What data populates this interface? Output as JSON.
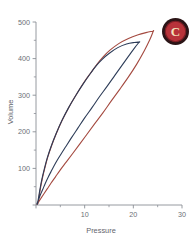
{
  "figure": {
    "panel_label": "C",
    "background_color": "#ffffff",
    "axis_color": "#8a8e95",
    "label_color": "#6b6f76"
  },
  "badge": {
    "letter": "C",
    "ring_color": "#2b1416",
    "fill_color": "#b8333a",
    "letter_color": "#f3e3bd",
    "name": "panel-label-c"
  },
  "chart_data": {
    "type": "line",
    "title": "",
    "xlabel": "Pressure",
    "ylabel": "Volume",
    "xlim": [
      0,
      30
    ],
    "ylim": [
      0,
      500
    ],
    "grid": false,
    "legend": "none",
    "xticks": [
      0,
      10,
      20,
      30
    ],
    "xtick_labels": [
      "",
      "10",
      "20",
      "30"
    ],
    "x_minor_ticks": [
      5,
      15,
      25
    ],
    "yticks": [
      0,
      100,
      200,
      300,
      400,
      500
    ],
    "ytick_labels": [
      "",
      "100",
      "200",
      "300",
      "400",
      "500"
    ],
    "y_minor_ticks": [
      50,
      150,
      250,
      350,
      450
    ],
    "series": [
      {
        "name": "red-loop",
        "color": "#a4493f",
        "line_width": 1.1,
        "closed": true,
        "description": "outer pressure-volume hysteresis loop",
        "inflation_x": [
          0.4,
          0.6,
          0.9,
          1.3,
          1.8,
          2.4,
          3.2,
          4.2,
          5.4,
          6.8,
          8.3,
          9.8,
          11.3,
          12.6,
          13.8,
          15.2,
          17.0,
          19.0,
          21.0,
          22.6,
          23.6,
          24.1
        ],
        "inflation_y": [
          4,
          20,
          45,
          72,
          100,
          130,
          162,
          196,
          232,
          268,
          302,
          334,
          362,
          386,
          405,
          423,
          441,
          455,
          465,
          471,
          474,
          475
        ],
        "deflation_x": [
          24.1,
          23.4,
          22.2,
          20.7,
          19.0,
          17.2,
          15.4,
          13.7,
          12.0,
          10.4,
          8.9,
          7.5,
          6.2,
          5.0,
          4.0,
          3.1,
          2.3,
          1.6,
          1.0,
          0.5,
          0.2
        ],
        "deflation_y": [
          475,
          452,
          420,
          385,
          350,
          316,
          283,
          251,
          221,
          192,
          165,
          140,
          117,
          96,
          77,
          60,
          44,
          30,
          18,
          8,
          2
        ]
      },
      {
        "name": "blue-loop",
        "color": "#2d3c58",
        "line_width": 1.1,
        "closed": true,
        "description": "inner pressure-volume hysteresis loop",
        "inflation_x": [
          0.3,
          0.5,
          0.8,
          1.2,
          1.7,
          2.3,
          3.1,
          4.1,
          5.3,
          6.7,
          8.2,
          9.7,
          11.1,
          12.4,
          13.6,
          15.0,
          16.8,
          18.6,
          20.2,
          21.2
        ],
        "inflation_y": [
          3,
          18,
          42,
          70,
          98,
          128,
          160,
          194,
          230,
          266,
          300,
          331,
          358,
          381,
          398,
          414,
          430,
          440,
          444,
          445
        ],
        "deflation_x": [
          21.2,
          20.3,
          19.1,
          17.7,
          16.2,
          14.6,
          13.0,
          11.5,
          10.0,
          8.6,
          7.3,
          6.1,
          5.0,
          4.0,
          3.2,
          2.5,
          1.9,
          1.4,
          0.9,
          0.5,
          0.2
        ],
        "deflation_y": [
          445,
          430,
          408,
          382,
          354,
          324,
          295,
          266,
          238,
          210,
          184,
          159,
          136,
          114,
          94,
          76,
          59,
          43,
          28,
          14,
          3
        ]
      }
    ],
    "annotations": [
      {
        "text": "C",
        "position": "top-right",
        "style": "circular-badge"
      }
    ]
  }
}
